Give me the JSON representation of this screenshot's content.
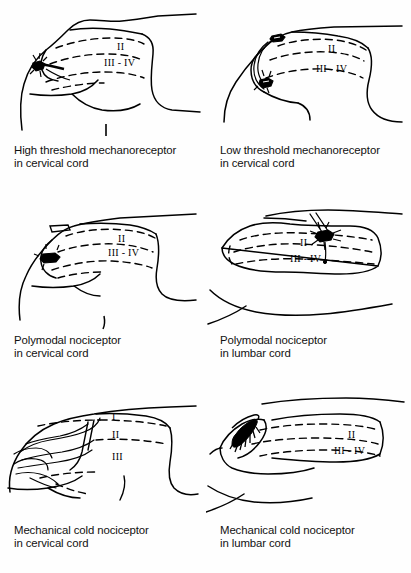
{
  "figure": {
    "type": "scientific-line-drawing-grid",
    "rows": 3,
    "columns": 2,
    "ink_color": "#000000",
    "background_color": "#fefefe"
  },
  "panels": [
    {
      "id": "high-threshold-mechanoreceptor-cervical",
      "caption_line1": "High threshold mechanoreceptor",
      "caption_line2": "in cervical cord",
      "laminae": [
        "II",
        "III - IV"
      ],
      "cord_region": "cervical",
      "afferent_type": "High threshold mechanoreceptor"
    },
    {
      "id": "low-threshold-mechanoreceptor-cervical",
      "caption_line1": "Low threshold mechanoreceptor",
      "caption_line2": "in cervical cord",
      "laminae": [
        "II",
        "III - IV"
      ],
      "cord_region": "cervical",
      "afferent_type": "Low threshold mechanoreceptor"
    },
    {
      "id": "polymodal-nociceptor-cervical",
      "caption_line1": "Polymodal nociceptor",
      "caption_line2": "in cervical cord",
      "laminae": [
        "II",
        "III - IV"
      ],
      "cord_region": "cervical",
      "afferent_type": "Polymodal nociceptor"
    },
    {
      "id": "polymodal-nociceptor-lumbar",
      "caption_line1": "Polymodal nociceptor",
      "caption_line2": "in lumbar cord",
      "laminae": [
        "II",
        "III - IV"
      ],
      "cord_region": "lumbar",
      "afferent_type": "Polymodal nociceptor"
    },
    {
      "id": "mechanical-cold-nociceptor-cervical",
      "caption_line1": "Mechanical cold nociceptor",
      "caption_line2": "in cervical cord",
      "laminae": [
        "I",
        "II",
        "III"
      ],
      "cord_region": "cervical",
      "afferent_type": "Mechanical cold nociceptor"
    },
    {
      "id": "mechanical-cold-nociceptor-lumbar",
      "caption_line1": "Mechanical cold nociceptor",
      "caption_line2": "in lumbar cord",
      "laminae": [
        "II",
        "III - IV"
      ],
      "cord_region": "lumbar",
      "afferent_type": "Mechanical cold nociceptor"
    }
  ]
}
